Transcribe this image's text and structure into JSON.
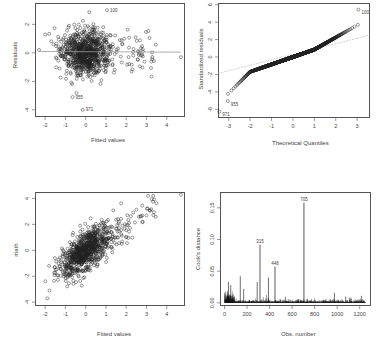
{
  "chart_data": [
    {
      "id": "residuals_vs_fitted",
      "type": "scatter",
      "title": "",
      "xlabel": "Fitted values",
      "ylabel": "Residuals",
      "xlim": [
        -2.5,
        4.9
      ],
      "ylim": [
        -4.5,
        3.5
      ],
      "xticks": [
        -2,
        -1,
        0,
        1,
        2,
        3,
        4
      ],
      "yticks": [
        2,
        0,
        -2,
        -4
      ],
      "grid": false,
      "smooth_line": {
        "y": 0.05
      },
      "n_points": 900,
      "annotations": [
        {
          "label": "100",
          "x": 1.2,
          "y": 3.0
        },
        {
          "label": "955",
          "x": -0.5,
          "y": -3.1
        },
        {
          "label": "971",
          "x": 0.0,
          "y": -4.0
        }
      ],
      "frame": {
        "left": 35,
        "top": 3,
        "width": 150,
        "height": 114
      }
    },
    {
      "id": "normal_qq",
      "type": "scatter",
      "title": "",
      "xlabel": "Theoretical Quantiles",
      "ylabel": "Standardized residuals",
      "xlim": [
        -3.5,
        3.6
      ],
      "ylim": [
        -7,
        6.2
      ],
      "xticks": [
        -3,
        -2,
        -1,
        0,
        1,
        2,
        3
      ],
      "yticks": [
        6,
        4,
        2,
        0,
        -2,
        -4,
        -6
      ],
      "grid": false,
      "reference_line": {
        "slope": 1.0,
        "intercept": 0.0
      },
      "n_points": 1260,
      "annotations": [
        {
          "label": "100",
          "x": 3.2,
          "y": 5.1
        },
        {
          "label": "955",
          "x": -2.9,
          "y": -5.4
        },
        {
          "label": "971",
          "x": -3.3,
          "y": -6.6
        }
      ],
      "frame": {
        "left": 218,
        "top": 3,
        "width": 152,
        "height": 115
      }
    },
    {
      "id": "math_vs_fitted",
      "type": "scatter",
      "title": "",
      "xlabel": "Fitted values",
      "ylabel": "math",
      "xlim": [
        -2.5,
        4.9
      ],
      "ylim": [
        -4.3,
        4.5
      ],
      "xticks": [
        -2,
        -1,
        0,
        1,
        2,
        3,
        4
      ],
      "yticks": [
        4,
        2,
        0,
        -2,
        -4
      ],
      "grid": false,
      "n_points": 900,
      "frame": {
        "left": 35,
        "top": 192,
        "width": 150,
        "height": 114
      }
    },
    {
      "id": "cooks_distance",
      "type": "bar",
      "title": "",
      "xlabel": "Obs. number",
      "ylabel": "Cook's distance",
      "xlim": [
        -40,
        1300
      ],
      "ylim": [
        -0.005,
        0.175
      ],
      "xticks": [
        0,
        200,
        400,
        600,
        800,
        1000,
        1200
      ],
      "yticks": [
        0.0,
        0.05,
        0.1,
        0.15
      ],
      "ytick_labels": [
        "0.00",
        "0.05",
        "0.10",
        "0.15"
      ],
      "grid": false,
      "highlight_bars": [
        {
          "obs": 705,
          "value": 0.158,
          "label": "705"
        },
        {
          "obs": 315,
          "value": 0.092,
          "label": "315"
        },
        {
          "obs": 448,
          "value": 0.057,
          "label": "448"
        }
      ],
      "other_notable_bars": [
        {
          "obs": 140,
          "value": 0.042
        },
        {
          "obs": 35,
          "value": 0.033
        },
        {
          "obs": 55,
          "value": 0.028
        },
        {
          "obs": 290,
          "value": 0.033
        },
        {
          "obs": 390,
          "value": 0.04
        },
        {
          "obs": 170,
          "value": 0.022
        },
        {
          "obs": 975,
          "value": 0.016
        },
        {
          "obs": 1075,
          "value": 0.01
        },
        {
          "obs": 1215,
          "value": 0.011
        }
      ],
      "n_obs": 1250,
      "frame": {
        "left": 220,
        "top": 192,
        "width": 151,
        "height": 114
      }
    }
  ]
}
